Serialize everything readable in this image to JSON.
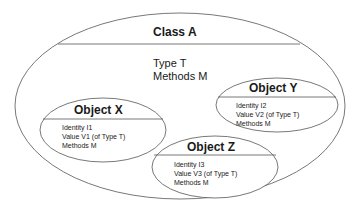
{
  "class": {
    "title": "Class A",
    "attributes": [
      "Type T",
      "Methods M"
    ]
  },
  "objects": [
    {
      "title": "Object X",
      "attributes": [
        "Identity I1",
        "Value V1 (of Type T)",
        "Methods M"
      ]
    },
    {
      "title": "Object Y",
      "attributes": [
        "Identity I2",
        "Value V2 (of Type T)",
        "Methods M"
      ]
    },
    {
      "title": "Object Z",
      "attributes": [
        "Identity I3",
        "Value V3 (of Type T)",
        "Methods M"
      ]
    }
  ],
  "colors": {
    "stroke": "#555555",
    "text": "#1a1a1a",
    "background": "#ffffff"
  }
}
